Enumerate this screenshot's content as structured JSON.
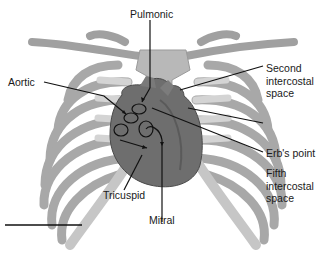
{
  "figure": {
    "labels": {
      "pulmonic": "Pulmonic",
      "aortic": "Aortic",
      "second_ics": "Second\nintercostal\nspace",
      "erbs_point": "Erb's point",
      "fifth_ics": "Fifth\nintercostal\nspace",
      "tricuspid": "Tricuspid",
      "mitral": "Mitral"
    },
    "colors": {
      "bone": "#b4b4b4",
      "bone_edge": "#8c8c8c",
      "cartilage": "#d2d2d2",
      "heart": "#6e6e6e",
      "heart_dark": "#5a5a5a",
      "line": "#111111"
    }
  }
}
